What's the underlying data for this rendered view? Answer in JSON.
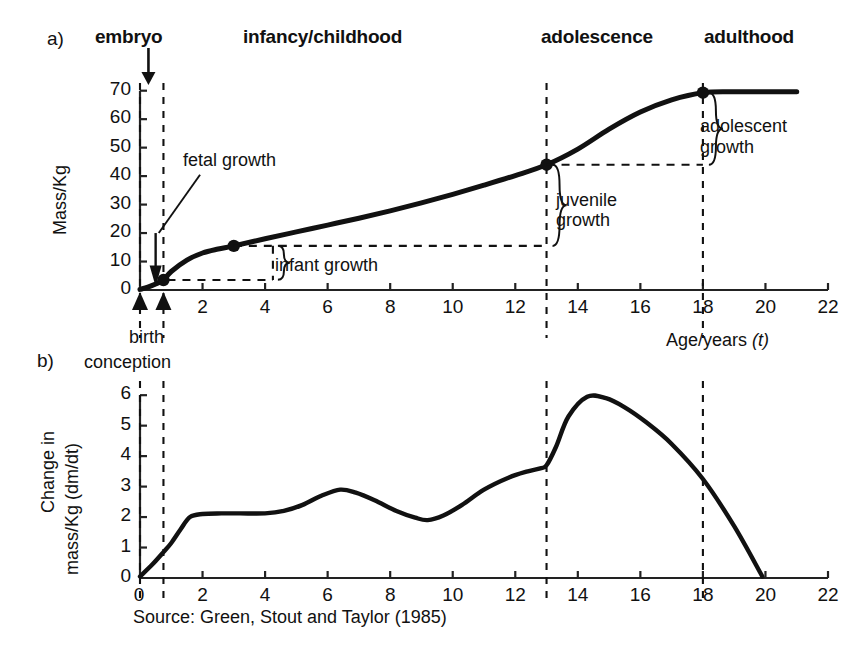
{
  "figure": {
    "source_note": "Source: Green, Stout and Taylor (1985)",
    "stage_labels": [
      {
        "id": "embryo",
        "text": "embryo",
        "x": 95,
        "y": 26
      },
      {
        "id": "infancy-childhood",
        "text": "infancy/childhood",
        "x": 243,
        "y": 26
      },
      {
        "id": "adolescence",
        "text": "adolescence",
        "x": 541,
        "y": 26
      },
      {
        "id": "adulthood",
        "text": "adulthood",
        "x": 704,
        "y": 26
      }
    ],
    "panel_a_letter": "a)",
    "panel_b_letter": "b)",
    "markers": {
      "conception": "conception",
      "birth": "birth"
    },
    "colors": {
      "curve": "#111111",
      "axis": "#222222",
      "dashed": "#111111",
      "background": "#ffffff"
    }
  },
  "chart_data": [
    {
      "id": "panel-a",
      "type": "line",
      "title": "a)",
      "xlabel": "Age/years (t)",
      "ylabel": "Mass/Kg",
      "xlim": [
        0,
        22
      ],
      "ylim": [
        0,
        72
      ],
      "xticks": [
        0,
        2,
        4,
        6,
        8,
        10,
        12,
        14,
        16,
        18,
        20,
        22
      ],
      "xticklabels": [
        "0",
        "2",
        "4",
        "6",
        "8",
        "10",
        "12",
        "14",
        "16",
        "18",
        "20",
        "22"
      ],
      "yticks": [
        0,
        10,
        20,
        30,
        40,
        50,
        60,
        70
      ],
      "yticklabels": [
        "0",
        "10",
        "20",
        "30",
        "40",
        "50",
        "60",
        "70"
      ],
      "grid": false,
      "legend": false,
      "series": [
        {
          "name": "Body mass",
          "x": [
            0,
            0.25,
            0.5,
            0.75,
            1.0,
            1.5,
            2.0,
            2.5,
            3.0,
            4.0,
            5.0,
            6.0,
            7.0,
            8.0,
            9.0,
            10.0,
            11.0,
            12.0,
            13.0,
            14.0,
            15.0,
            16.0,
            17.0,
            18.0,
            19.0,
            20.0,
            21.0
          ],
          "y": [
            0.2,
            1.0,
            2.1,
            3.5,
            6.5,
            10.5,
            13.0,
            14.4,
            15.5,
            18.0,
            20.4,
            22.8,
            25.2,
            27.8,
            30.6,
            33.6,
            36.8,
            40.2,
            44.0,
            49.5,
            56.5,
            62.5,
            66.8,
            69.3,
            69.6,
            69.6,
            69.6
          ]
        }
      ],
      "data_points": [
        {
          "name": "birth-point",
          "x": 0.75,
          "y": 3.5
        },
        {
          "name": "infant-point",
          "x": 3.0,
          "y": 15.5
        },
        {
          "name": "juvenile-point",
          "x": 13.0,
          "y": 44.0
        },
        {
          "name": "adolescent-point",
          "x": 18.0,
          "y": 69.3
        }
      ],
      "vertical_markers": [
        {
          "name": "conception-line",
          "x": 0.0
        },
        {
          "name": "birth-line",
          "x": 0.75
        },
        {
          "name": "adolescence-line",
          "x": 13.0
        },
        {
          "name": "adulthood-line",
          "x": 18.0
        }
      ],
      "annotations": [
        {
          "name": "fetal-growth",
          "text": "fetal growth",
          "x": 2.1,
          "y": 48
        },
        {
          "name": "infant-growth",
          "text": "infant growth",
          "x": 4.6,
          "y": 10.5
        },
        {
          "name": "juvenile-growth",
          "text": "juvenile\ngrowth",
          "line1": "juvenile",
          "line2": "growth",
          "x": 14.1,
          "y": 28
        },
        {
          "name": "adolescent-growth",
          "text": "adolescent\ngrowth",
          "line1": "adolescent",
          "line2": "growth",
          "x": 19.1,
          "y": 58
        }
      ]
    },
    {
      "id": "panel-b",
      "type": "line",
      "title": "b)",
      "xlabel": "",
      "ylabel": "Change in mass/Kg (dm/dt)",
      "ylabel_line1": "Change in",
      "ylabel_line2": "mass/Kg (dm/dt)",
      "xlim": [
        0,
        22
      ],
      "ylim": [
        0,
        6.4
      ],
      "xticks": [
        0,
        2,
        4,
        6,
        8,
        10,
        12,
        14,
        16,
        18,
        20,
        22
      ],
      "xticklabels": [
        "0",
        "2",
        "4",
        "6",
        "8",
        "10",
        "12",
        "14",
        "16",
        "18",
        "20",
        "22"
      ],
      "yticks": [
        0,
        1,
        2,
        3,
        4,
        5,
        6
      ],
      "yticklabels": [
        "0",
        "1",
        "2",
        "3",
        "4",
        "5",
        "6"
      ],
      "grid": false,
      "legend": false,
      "series": [
        {
          "name": "Rate of mass change",
          "x": [
            0,
            0.4,
            0.75,
            1.0,
            1.3,
            1.6,
            2.0,
            2.6,
            3.2,
            4.0,
            4.6,
            5.2,
            5.8,
            6.4,
            6.9,
            7.5,
            8.2,
            8.8,
            9.2,
            9.7,
            10.3,
            11.0,
            11.8,
            12.4,
            12.8,
            13.0,
            13.3,
            13.7,
            14.3,
            14.9,
            15.5,
            16.2,
            17.0,
            18.0,
            19.0,
            19.9
          ],
          "y": [
            0.05,
            0.45,
            0.85,
            1.15,
            1.6,
            2.0,
            2.1,
            2.12,
            2.12,
            2.12,
            2.2,
            2.4,
            2.7,
            2.9,
            2.8,
            2.55,
            2.2,
            1.98,
            1.9,
            2.05,
            2.4,
            2.9,
            3.3,
            3.5,
            3.6,
            3.7,
            4.3,
            5.3,
            5.95,
            5.9,
            5.6,
            5.1,
            4.4,
            3.25,
            1.7,
            0.05
          ]
        }
      ],
      "data_points": [],
      "vertical_markers": [
        {
          "name": "conception-line",
          "x": 0.0
        },
        {
          "name": "birth-line",
          "x": 0.75
        },
        {
          "name": "adolescence-line",
          "x": 13.0
        },
        {
          "name": "adulthood-line",
          "x": 18.0
        }
      ],
      "annotations": []
    }
  ]
}
